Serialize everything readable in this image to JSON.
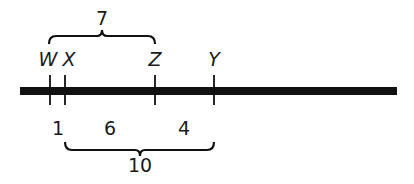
{
  "diagram": {
    "type": "number-line-segments",
    "line_color": "#111111",
    "points": [
      {
        "label": "W",
        "x": 50
      },
      {
        "label": "X",
        "x": 65
      },
      {
        "label": "Z",
        "x": 155
      },
      {
        "label": "Y",
        "x": 214
      }
    ],
    "top_brace": {
      "from": "W",
      "to": "Z",
      "value": "7"
    },
    "segment_lengths": [
      {
        "from": "W",
        "to": "X",
        "value": "1"
      },
      {
        "from": "X",
        "to": "Z",
        "value": "6"
      },
      {
        "from": "Z",
        "to": "Y",
        "value": "4"
      }
    ],
    "bottom_brace": {
      "from": "X",
      "to": "Y",
      "value": "10"
    }
  }
}
